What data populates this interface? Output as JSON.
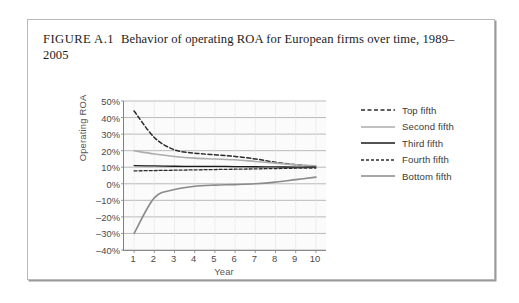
{
  "figure": {
    "label": "FIGURE A.1",
    "title": "Behavior of operating ROA for European firms over time, 1989–2005"
  },
  "chart_data": {
    "type": "line",
    "title": "Behavior of operating ROA for European firms over time, 1989–2005",
    "xlabel": "Year",
    "ylabel": "Operating ROA",
    "x": [
      1,
      2,
      3,
      4,
      5,
      6,
      7,
      8,
      9,
      10
    ],
    "xlim": [
      0.5,
      10.5
    ],
    "ylim": [
      -40,
      50
    ],
    "xticks": [
      "1",
      "2",
      "3",
      "4",
      "5",
      "6",
      "7",
      "8",
      "9",
      "10"
    ],
    "yticks": [
      "50%",
      "40%",
      "30%",
      "20%",
      "10%",
      "0%",
      "–10%",
      "–20%",
      "–30%",
      "–40%"
    ],
    "ytick_values": [
      50,
      40,
      30,
      20,
      10,
      0,
      -10,
      -20,
      -30,
      -40
    ],
    "grid": "horizontal",
    "legend_position": "right",
    "series": [
      {
        "name": "Top fifth",
        "values": [
          44,
          28,
          20.5,
          18.5,
          17.5,
          16.5,
          15,
          13,
          11.5,
          10.5
        ],
        "color": "#2b2b2b",
        "dash": "4,2.5",
        "width": 1.5
      },
      {
        "name": "Second fifth",
        "values": [
          20,
          18,
          16.5,
          15.5,
          15,
          14.5,
          13.5,
          12.5,
          11.5,
          10.8
        ],
        "color": "#adadad",
        "dash": "none",
        "width": 1.6
      },
      {
        "name": "Third fifth",
        "values": [
          11,
          10.8,
          10.6,
          10.5,
          10.5,
          10.4,
          10.3,
          10.2,
          10.1,
          10.1
        ],
        "color": "#1a1a1a",
        "dash": "none",
        "width": 1.3
      },
      {
        "name": "Fourth fifth",
        "values": [
          7.8,
          8.0,
          8.2,
          8.4,
          8.6,
          8.8,
          9.0,
          9.2,
          9.4,
          9.5
        ],
        "color": "#2b2b2b",
        "dash": "3,2",
        "width": 1.3
      },
      {
        "name": "Bottom fifth",
        "values": [
          -30,
          -8.5,
          -3.5,
          -1.5,
          -0.8,
          -0.5,
          0,
          1,
          2.5,
          4
        ],
        "color": "#8a8a8a",
        "dash": "none",
        "width": 1.6
      }
    ]
  }
}
